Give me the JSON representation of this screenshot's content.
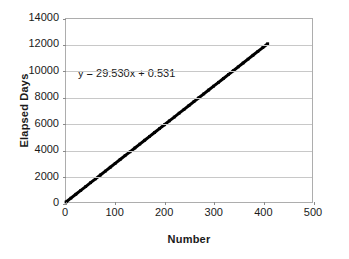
{
  "chart_data": {
    "type": "line",
    "title": "",
    "xlabel": "Number",
    "ylabel": "Elapsed Days",
    "xlim": [
      0,
      500
    ],
    "ylim": [
      0,
      14000
    ],
    "xticks": [
      0,
      100,
      200,
      300,
      400,
      500
    ],
    "yticks": [
      0,
      2000,
      4000,
      6000,
      8000,
      10000,
      12000,
      14000
    ],
    "xtick_labels": [
      "0",
      "100",
      "200",
      "300",
      "400",
      "500"
    ],
    "ytick_labels": [
      "0",
      "2000",
      "4000",
      "6000",
      "8000",
      "10000",
      "12000",
      "14000"
    ],
    "grid": "horizontal",
    "legend": "none",
    "annotations": [
      {
        "name": "trendline-equation",
        "text": "y = 29.530x + 0.531",
        "x": 40,
        "y": 9500
      }
    ],
    "series": [
      {
        "name": "Elapsed Days vs Number",
        "color": "#000000",
        "line_width": 3,
        "fit": {
          "slope": 29.53,
          "intercept": 0.531,
          "equation": "y = 29.530x + 0.531"
        },
        "x": [
          0,
          10,
          20,
          30,
          40,
          50,
          60,
          70,
          80,
          90,
          100,
          110,
          120,
          130,
          140,
          150,
          160,
          170,
          180,
          190,
          200,
          210,
          220,
          230,
          240,
          250,
          260,
          270,
          280,
          290,
          300,
          310,
          320,
          330,
          340,
          350,
          360,
          370,
          380,
          390,
          400,
          410
        ],
        "values": [
          0,
          295,
          591,
          886,
          1181,
          1477,
          1772,
          2068,
          2363,
          2658,
          2954,
          3249,
          3544,
          3840,
          4135,
          4431,
          4726,
          5021,
          5317,
          5612,
          5907,
          6203,
          6498,
          6794,
          7089,
          7384,
          7680,
          7975,
          8270,
          8566,
          8861,
          9157,
          9452,
          9747,
          10043,
          10338,
          10633,
          10929,
          11224,
          11520,
          11815,
          12110
        ]
      }
    ]
  }
}
